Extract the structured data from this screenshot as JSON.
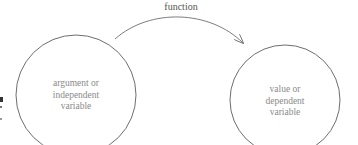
{
  "diagram": {
    "arrow_label": "function",
    "source": {
      "lines": [
        "argument or",
        "independent",
        "variable"
      ]
    },
    "target": {
      "lines": [
        "value or",
        "dependent",
        "variable"
      ]
    },
    "colors": {
      "stroke": "#6e6e6e",
      "text": "#8a8a8a"
    }
  }
}
